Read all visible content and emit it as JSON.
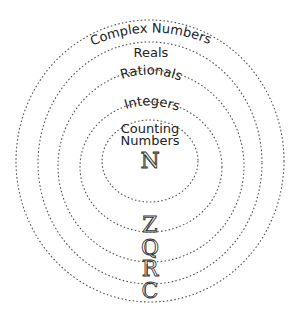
{
  "diagram": {
    "type": "nested-sets",
    "sets": [
      {
        "name": "complex",
        "label": "Complex Numbers",
        "symbol": "C"
      },
      {
        "name": "reals",
        "label": "Reals",
        "symbol": "R"
      },
      {
        "name": "rationals",
        "label": "Rationals",
        "symbol": "Q"
      },
      {
        "name": "integers",
        "label": "Integers",
        "symbol": "Z"
      },
      {
        "name": "counting",
        "label_line1": "Counting",
        "label_line2": "Numbers",
        "symbol": "N"
      }
    ],
    "colors": {
      "ink": "#333333",
      "background": "#ffffff"
    }
  }
}
